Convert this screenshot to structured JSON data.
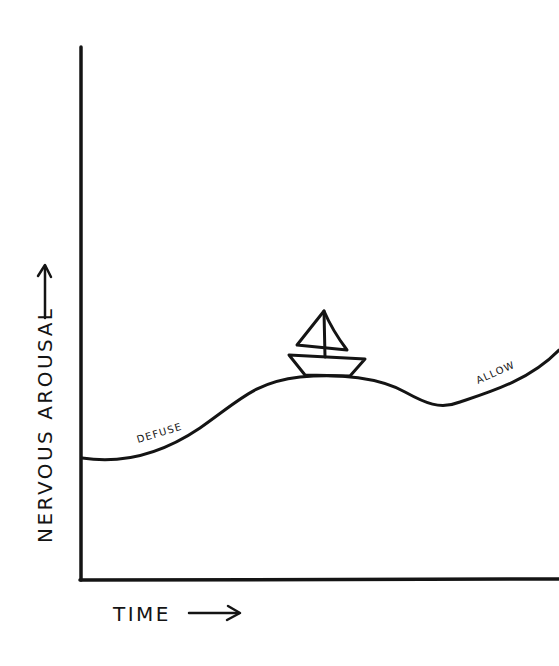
{
  "diagram": {
    "type": "hand-drawn wave diagram",
    "background_color": "#ffffff",
    "ink_color": "#141414",
    "axes": {
      "y_label": "NERVOUS AROUSAL",
      "y_arrow": "up-arrow",
      "x_label": "TIME",
      "x_arrow": "right-arrow"
    },
    "curve": {
      "description": "Wave of nervous arousal over time: low at start, rising to a crest, dipping to a trough, then rising again",
      "annotations": [
        {
          "id": "defuse",
          "text": "DEFUSE",
          "position": "rising slope before crest"
        },
        {
          "id": "allow",
          "text": "ALLOW",
          "position": "rising slope after trough"
        }
      ]
    },
    "boat": {
      "description": "Small sailboat riding on top of the wave crest",
      "icon": "sailboat-icon"
    }
  }
}
